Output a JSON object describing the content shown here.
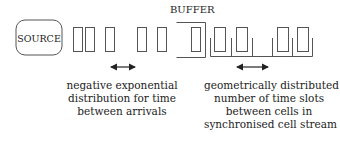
{
  "source": {
    "label": "SOURCE"
  },
  "buffer": {
    "label": "BUFFER"
  },
  "colors": {
    "stroke": "#555555",
    "text": "#222222",
    "background": "#ffffff"
  },
  "captions": {
    "left": {
      "lines": [
        "negative exponential",
        "distribution for time",
        "between arrivals"
      ]
    },
    "right": {
      "lines": [
        "geometrically distributed",
        "number of time slots",
        "between cells in",
        "synchronised cell stream"
      ]
    }
  }
}
